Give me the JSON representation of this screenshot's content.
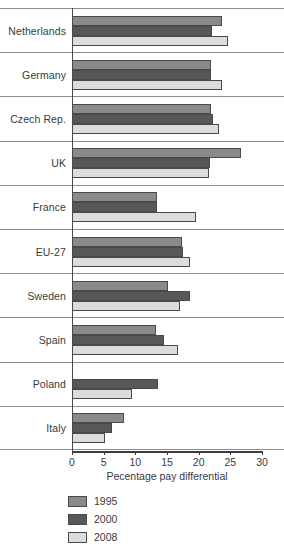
{
  "chart_data": {
    "type": "bar",
    "orientation": "horizontal",
    "title": "",
    "xlabel": "Pecentage pay differential",
    "ylabel": "",
    "xlim": [
      0,
      30
    ],
    "xticks": [
      0,
      5,
      10,
      15,
      20,
      25,
      30
    ],
    "xtick_labels": [
      "0",
      "5",
      "10",
      "15",
      "20",
      "25",
      "30"
    ],
    "grid": false,
    "legend_position": "bottom-left",
    "categories": [
      "Netherlands",
      "Germany",
      "Czech Rep.",
      "UK",
      "France",
      "EU-27",
      "Sweden",
      "Spain",
      "Poland",
      "Italy"
    ],
    "series": [
      {
        "name": "1995",
        "color": "#8a8a8a",
        "values": [
          23.7,
          22.0,
          22.0,
          26.7,
          13.4,
          17.4,
          15.2,
          13.3,
          null,
          8.2
        ]
      },
      {
        "name": "2000",
        "color": "#585858",
        "values": [
          22.1,
          22.0,
          22.3,
          21.8,
          13.4,
          17.5,
          18.6,
          14.5,
          13.6,
          6.3
        ]
      },
      {
        "name": "2008",
        "color": "#dcdcdc",
        "values": [
          24.6,
          23.7,
          23.2,
          21.6,
          19.6,
          18.6,
          17.1,
          16.8,
          9.5,
          5.2
        ]
      }
    ]
  },
  "legend": {
    "items": [
      {
        "label": "1995",
        "color": "#8a8a8a"
      },
      {
        "label": "2000",
        "color": "#585858"
      },
      {
        "label": "2008",
        "color": "#dcdcdc"
      }
    ]
  }
}
